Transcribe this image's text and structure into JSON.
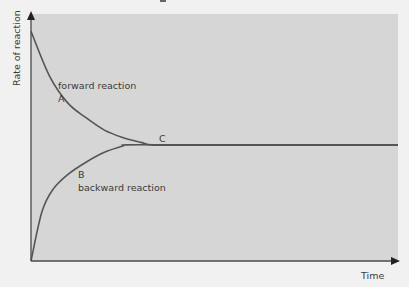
{
  "chart_data": {
    "type": "line",
    "title": "",
    "xlabel": "Time",
    "ylabel": "Rate of reaction",
    "xlim": [
      0,
      10
    ],
    "ylim": [
      0,
      10
    ],
    "grid": false,
    "legend": "none",
    "equilibrium_rate": 4.7,
    "series": [
      {
        "name": "forward reaction",
        "marker": "A",
        "x": [
          0,
          0.5,
          1,
          1.5,
          2,
          2.5,
          3,
          3.3,
          4,
          6,
          10
        ],
        "y": [
          9.3,
          7.5,
          6.4,
          5.8,
          5.3,
          5.0,
          4.8,
          4.7,
          4.7,
          4.7,
          4.7
        ]
      },
      {
        "name": "backward reaction",
        "marker": "B",
        "x": [
          0,
          0.3,
          0.6,
          1,
          1.5,
          2,
          2.5,
          2.6,
          4,
          6,
          10
        ],
        "y": [
          0,
          2.0,
          2.9,
          3.5,
          4.0,
          4.4,
          4.65,
          4.7,
          4.7,
          4.7,
          4.7
        ]
      }
    ],
    "annotations": [
      {
        "text": "forward reaction",
        "near": "series A upper"
      },
      {
        "text": "A",
        "near": "forward curve"
      },
      {
        "text": "C",
        "near": "equilibrium plateau"
      },
      {
        "text": "B",
        "near": "backward curve"
      },
      {
        "text": "backward reaction",
        "near": "series B lower"
      }
    ]
  },
  "labels": {
    "forward": "forward reaction",
    "a": "A",
    "c": "C",
    "b": "B",
    "backward": "backward reaction",
    "xlabel": "Time",
    "ylabel": "Rate of reaction"
  },
  "colors": {
    "panel": "#d6d6d6",
    "line": "#555555",
    "axis": "#4a4a4a"
  }
}
